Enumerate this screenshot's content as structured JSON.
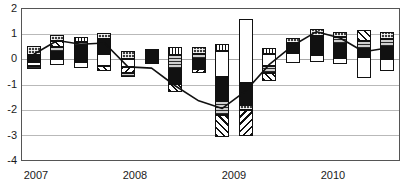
{
  "chart_data": {
    "type": "bar",
    "subtype": "stacked-bar-with-line",
    "title": "",
    "xlabel": "",
    "ylabel": "",
    "ylim": [
      -4,
      2
    ],
    "yticks": [
      2,
      1,
      0,
      -1,
      -2,
      -3,
      -4
    ],
    "ytick_labels": [
      "2",
      "1",
      "0",
      "-1",
      "-2",
      "-3",
      "-4"
    ],
    "xtick_labels": [
      "2007",
      "2008",
      "2009",
      "2010"
    ],
    "grid": true,
    "legend": "none",
    "categories": [
      "2007Q1",
      "2007Q2",
      "2007Q3",
      "2007Q4",
      "2008Q1",
      "2008Q2",
      "2008Q3",
      "2008Q4",
      "2009Q1",
      "2009Q2",
      "2009Q3",
      "2009Q4",
      "2010Q1",
      "2010Q2",
      "2010Q3",
      "2010Q4"
    ],
    "line": {
      "name": "Total",
      "values": [
        0.2,
        0.75,
        0.6,
        0.65,
        -0.3,
        -0.35,
        -1.05,
        -1.65,
        -1.95,
        -1.25,
        -0.2,
        0.55,
        1.1,
        0.85,
        0.3,
        0.45
      ]
    },
    "series": [
      {
        "name": "Segment A",
        "fill": "f-dkgrid",
        "values": [
          0.35,
          0.3,
          0.35,
          0.4,
          0.22,
          0.2,
          0.38,
          0.3,
          0.28,
          0.25,
          0.3,
          0.32,
          0.3,
          0.3,
          0.45,
          0.35
        ]
      },
      {
        "name": "Segment B",
        "fill": "f-diag",
        "values": [
          0.0,
          0.25,
          0.0,
          0.0,
          0.0,
          0.0,
          0.0,
          0.0,
          0.0,
          0.3,
          0.0,
          0.0,
          0.0,
          0.0,
          0.0,
          0.0
        ]
      },
      {
        "name": "Segment C",
        "fill": "f-hatchgray",
        "values": [
          0.18,
          0.25,
          0.25,
          0.25,
          0.18,
          0.0,
          0.0,
          0.22,
          0.35,
          0.4,
          0.2,
          0.3,
          0.25,
          0.38,
          0.25,
          0.35
        ]
      },
      {
        "name": "Segment D",
        "fill": "f-black",
        "values": [
          0.3,
          0.55,
          0.55,
          0.7,
          0.35,
          0.55,
          0.8,
          0.95,
          1.15,
          0.3,
          0.45,
          0.9,
          0.85,
          0.7,
          0.38,
          0.6
        ]
      },
      {
        "name": "Segment E",
        "fill": "f-white",
        "values": [
          0.35,
          0.45,
          0.3,
          0.7,
          0.3,
          0.3,
          0.18,
          1.3,
          1.7,
          0.4,
          0.85,
          0.5,
          0.25,
          0.55,
          1.35,
          0.75
        ]
      },
      {
        "name": "Segment F",
        "fill": "f-diag2",
        "values": [
          0.0,
          0.0,
          0.0,
          0.3,
          0.3,
          0.0,
          0.0,
          0.0,
          1.05,
          1.05,
          0.25,
          0.0,
          0.0,
          0.0,
          0.0,
          0.0
        ]
      },
      {
        "name": "Segment G",
        "fill": "f-vert",
        "values": [
          0.0,
          0.0,
          0.0,
          0.0,
          0.0,
          0.0,
          0.0,
          0.0,
          0.25,
          0.25,
          0.0,
          0.0,
          0.0,
          0.0,
          0.0,
          0.0
        ]
      }
    ],
    "bars": [
      {
        "cat": "2007Q1",
        "top": 0.53,
        "bottom": -0.38,
        "segments": [
          {
            "fill": "f-dkgrid",
            "h": 0.35
          },
          {
            "fill": "f-black",
            "h": 0.3
          },
          {
            "fill": "f-white",
            "h": 0.16
          },
          {
            "fill": "f-hatchgray",
            "h": 0.12
          }
        ]
      },
      {
        "cat": "2007Q2",
        "top": 0.95,
        "bottom": -0.22,
        "segments": [
          {
            "fill": "f-dkgrid",
            "h": 0.22
          },
          {
            "fill": "f-diag",
            "h": 0.25
          },
          {
            "fill": "f-hatchgray",
            "h": 0.18
          },
          {
            "fill": "f-black",
            "h": 0.3
          },
          {
            "fill": "f-white",
            "h": 0.22
          }
        ]
      },
      {
        "cat": "2007Q3",
        "top": 0.9,
        "bottom": -0.35,
        "segments": [
          {
            "fill": "f-vert",
            "h": 0.2
          },
          {
            "fill": "f-hatchgray",
            "h": 0.18
          },
          {
            "fill": "f-black",
            "h": 0.62
          },
          {
            "fill": "f-white",
            "h": 0.25
          }
        ]
      },
      {
        "cat": "2007Q4",
        "top": 1.05,
        "bottom": -0.45,
        "segments": [
          {
            "fill": "f-dkgrid",
            "h": 0.25
          },
          {
            "fill": "f-black",
            "h": 0.6
          },
          {
            "fill": "f-white",
            "h": 0.45
          },
          {
            "fill": "f-diag",
            "h": 0.2
          }
        ]
      },
      {
        "cat": "2008Q1",
        "top": 0.35,
        "bottom": -0.7,
        "segments": [
          {
            "fill": "f-dkgrid",
            "h": 0.35
          },
          {
            "fill": "f-white",
            "h": 0.3
          },
          {
            "fill": "f-diag2",
            "h": 0.25
          },
          {
            "fill": "f-hatchgray",
            "h": 0.15
          }
        ]
      },
      {
        "cat": "2008Q2",
        "top": 0.42,
        "bottom": -0.2,
        "segments": [
          {
            "fill": "f-black",
            "h": 0.52
          },
          {
            "fill": "f-white",
            "h": 0.1
          }
        ]
      },
      {
        "cat": "2008Q3",
        "top": 0.48,
        "bottom": -1.3,
        "segments": [
          {
            "fill": "f-vert",
            "h": 0.32
          },
          {
            "fill": "f-hatchgray",
            "h": 0.55
          },
          {
            "fill": "f-black",
            "h": 0.6
          },
          {
            "fill": "f-diag",
            "h": 0.31
          }
        ]
      },
      {
        "cat": "2008Q4",
        "top": 0.5,
        "bottom": -0.55,
        "segments": [
          {
            "fill": "f-dkgrid",
            "h": 0.28
          },
          {
            "fill": "f-hatchgray",
            "h": 0.22
          },
          {
            "fill": "f-black",
            "h": 0.4
          },
          {
            "fill": "f-diag2",
            "h": 0.15
          }
        ]
      },
      {
        "cat": "2009Q1",
        "top": 0.6,
        "bottom": -3.1,
        "segments": [
          {
            "fill": "f-vert",
            "h": 0.25
          },
          {
            "fill": "f-white",
            "h": 1.05
          },
          {
            "fill": "f-black",
            "h": 0.95
          },
          {
            "fill": "f-hatchgray",
            "h": 0.55
          },
          {
            "fill": "f-diag",
            "h": 0.9
          }
        ]
      },
      {
        "cat": "2009Q2",
        "top": 1.6,
        "bottom": -3.05,
        "segments": [
          {
            "fill": "f-white",
            "h": 2.55
          },
          {
            "fill": "f-black",
            "h": 0.85
          },
          {
            "fill": "f-dkgrid",
            "h": 0.22
          },
          {
            "fill": "f-diag2",
            "h": 1.03
          }
        ]
      },
      {
        "cat": "2009Q3",
        "top": 0.45,
        "bottom": -0.85,
        "segments": [
          {
            "fill": "f-vert",
            "h": 0.25
          },
          {
            "fill": "f-white",
            "h": 0.45
          },
          {
            "fill": "f-hatchgray",
            "h": 0.28
          },
          {
            "fill": "f-diag",
            "h": 0.32
          }
        ]
      },
      {
        "cat": "2009Q4",
        "top": 0.85,
        "bottom": -0.15,
        "segments": [
          {
            "fill": "f-dkgrid",
            "h": 0.22
          },
          {
            "fill": "f-black",
            "h": 0.38
          },
          {
            "fill": "f-white",
            "h": 0.4
          }
        ]
      },
      {
        "cat": "2010Q1",
        "top": 1.22,
        "bottom": -0.12,
        "segments": [
          {
            "fill": "f-dkgrid",
            "h": 0.28
          },
          {
            "fill": "f-black",
            "h": 0.75
          },
          {
            "fill": "f-white",
            "h": 0.31
          }
        ]
      },
      {
        "cat": "2010Q2",
        "top": 1.1,
        "bottom": -0.2,
        "segments": [
          {
            "fill": "f-dkgrid",
            "h": 0.22
          },
          {
            "fill": "f-hatchgray",
            "h": 0.28
          },
          {
            "fill": "f-black",
            "h": 0.55
          },
          {
            "fill": "f-white",
            "h": 0.25
          }
        ]
      },
      {
        "cat": "2010Q3",
        "top": 1.15,
        "bottom": -0.75,
        "segments": [
          {
            "fill": "f-diag",
            "h": 0.42
          },
          {
            "fill": "f-hatchgray",
            "h": 0.3
          },
          {
            "fill": "f-black",
            "h": 0.35
          },
          {
            "fill": "f-white",
            "h": 0.83
          }
        ]
      },
      {
        "cat": "2010Q4",
        "top": 1.1,
        "bottom": -0.45,
        "segments": [
          {
            "fill": "f-dkgrid",
            "h": 0.3
          },
          {
            "fill": "f-hatchgray",
            "h": 0.32
          },
          {
            "fill": "f-black",
            "h": 0.48
          },
          {
            "fill": "f-white",
            "h": 0.45
          }
        ]
      }
    ]
  },
  "axis": {
    "y_labels": [
      "2",
      "1",
      "0",
      "-1",
      "-2",
      "-3",
      "-4"
    ],
    "x_labels": [
      "2007",
      "2008",
      "2009",
      "2010"
    ]
  }
}
